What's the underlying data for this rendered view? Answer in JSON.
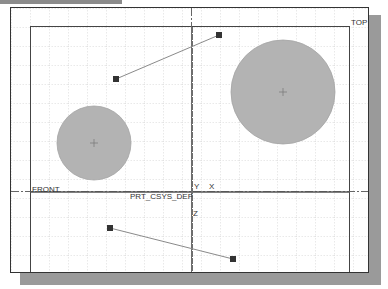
{
  "viewport": {
    "background": "#ffffff",
    "grid_color": "#c8c8c8",
    "grid_spacing": 19
  },
  "datums": {
    "top_label": "TOP",
    "front_label": "FRONT",
    "csys_label": "PRT_CSYS_DEF",
    "axis_y": "Y",
    "axis_x": "X",
    "axis_z": "Z"
  },
  "circles": [
    {
      "name": "small-circle",
      "cx": 94,
      "cy": 143,
      "r": 37,
      "fill": "#b3b3b3"
    },
    {
      "name": "large-circle",
      "cx": 283,
      "cy": 92,
      "r": 52,
      "fill": "#b3b3b3"
    }
  ],
  "segments": [
    {
      "name": "upper-segment",
      "x1": 116,
      "y1": 79,
      "x2": 219,
      "y2": 35
    },
    {
      "name": "lower-segment",
      "x1": 110,
      "y1": 228,
      "x2": 233,
      "y2": 259
    }
  ]
}
